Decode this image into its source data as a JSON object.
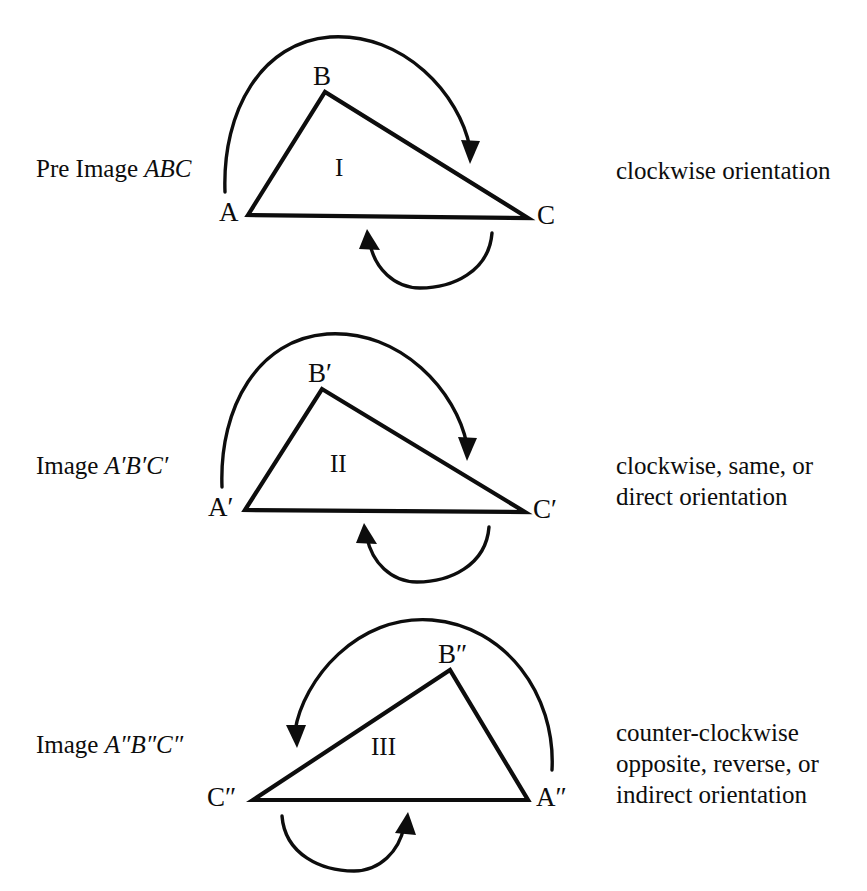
{
  "diagram": {
    "title_implied": "Orientation of a pre-image and its images",
    "ink_color": "#0d0d0d",
    "background_color": "#ffffff"
  },
  "panels": [
    {
      "id": "panel-1",
      "caption_prefix": "Pre Image ",
      "caption_italic": "ABC",
      "region_label": "I",
      "vertices": [
        {
          "name": "A",
          "label": "A"
        },
        {
          "name": "B",
          "label": "B"
        },
        {
          "name": "C",
          "label": "C"
        }
      ],
      "description": "clockwise orientation",
      "top_arrow_direction": "clockwise-over-top-to-right",
      "bottom_arrow_direction": "right-to-left"
    },
    {
      "id": "panel-2",
      "caption_prefix": "Image ",
      "caption_italic": "A′B′C′",
      "region_label": "II",
      "vertices": [
        {
          "name": "A-prime",
          "label": "A′"
        },
        {
          "name": "B-prime",
          "label": "B′"
        },
        {
          "name": "C-prime",
          "label": "C′"
        }
      ],
      "description": "clockwise, same, or\ndirect orientation",
      "top_arrow_direction": "clockwise-over-top-to-right",
      "bottom_arrow_direction": "right-to-left"
    },
    {
      "id": "panel-3",
      "caption_prefix": "Image ",
      "caption_italic": "A″B″C″",
      "region_label": "III",
      "vertices": [
        {
          "name": "C-double-prime",
          "label": "C″"
        },
        {
          "name": "B-double-prime",
          "label": "B″"
        },
        {
          "name": "A-double-prime",
          "label": "A″"
        }
      ],
      "description": "counter-clockwise\nopposite, reverse, or\nindirect orientation",
      "top_arrow_direction": "counter-clockwise-over-top-to-left",
      "bottom_arrow_direction": "left-to-right"
    }
  ]
}
